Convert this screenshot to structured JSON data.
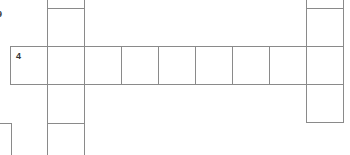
{
  "puzzle": {
    "type": "crossword",
    "across_4": {
      "clue_number": "4",
      "cells": 9
    },
    "partial_clue_number": "9",
    "line_color": "#8a8a8a"
  }
}
